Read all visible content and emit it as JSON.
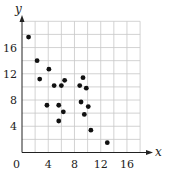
{
  "chart_data": {
    "type": "scatter",
    "title": "",
    "xlabel": "x",
    "ylabel": "y",
    "xlim": [
      0,
      18
    ],
    "ylim": [
      0,
      20
    ],
    "grid": true,
    "grid_step": 2,
    "xticks": [
      0,
      4,
      8,
      12,
      16
    ],
    "yticks": [
      4,
      8,
      12,
      16
    ],
    "origin_label": "0",
    "points": [
      {
        "x": 1.0,
        "y": 17.6
      },
      {
        "x": 2.3,
        "y": 14.0
      },
      {
        "x": 2.7,
        "y": 11.2
      },
      {
        "x": 4.1,
        "y": 12.7
      },
      {
        "x": 3.8,
        "y": 7.2
      },
      {
        "x": 4.9,
        "y": 10.2
      },
      {
        "x": 6.0,
        "y": 10.2
      },
      {
        "x": 6.5,
        "y": 11.0
      },
      {
        "x": 5.6,
        "y": 7.2
      },
      {
        "x": 5.6,
        "y": 4.8
      },
      {
        "x": 6.3,
        "y": 6.2
      },
      {
        "x": 8.8,
        "y": 10.2
      },
      {
        "x": 9.3,
        "y": 11.4
      },
      {
        "x": 9.8,
        "y": 9.8
      },
      {
        "x": 9.0,
        "y": 7.7
      },
      {
        "x": 10.1,
        "y": 7.0
      },
      {
        "x": 9.5,
        "y": 5.8
      },
      {
        "x": 10.5,
        "y": 3.4
      },
      {
        "x": 13.0,
        "y": 1.5
      }
    ],
    "colors": {
      "point": "#111111",
      "axis": "#222222",
      "grid": "#c8c8c8"
    }
  }
}
